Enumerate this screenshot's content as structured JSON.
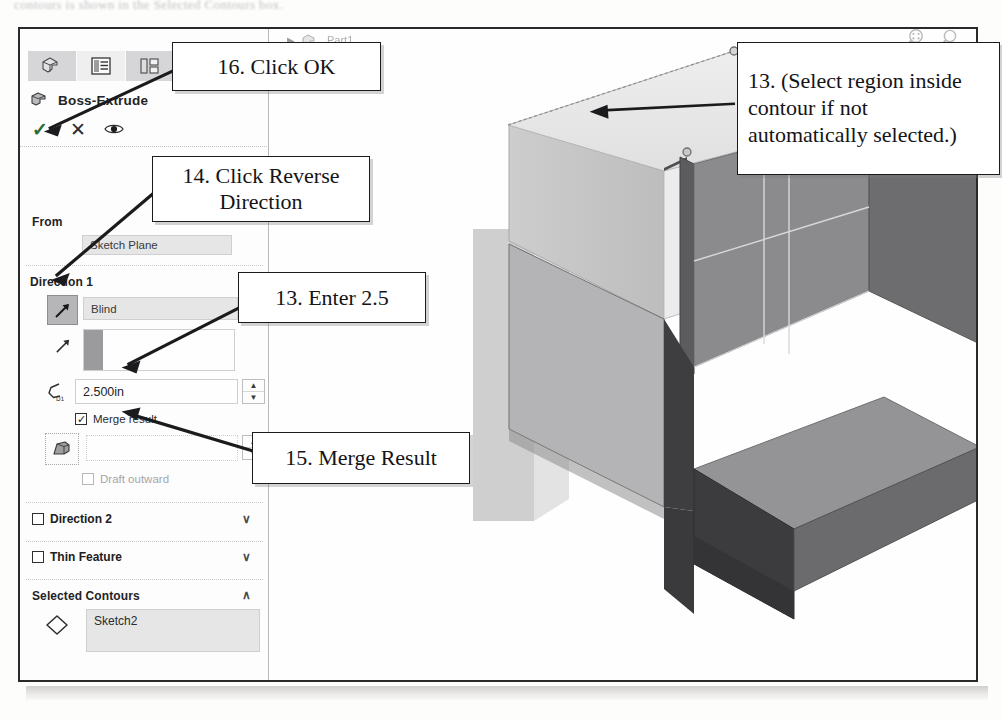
{
  "page": {
    "cutoff_top_text": "contours is shown in the Selected Contours box.",
    "app": "SolidWorks PropertyManager"
  },
  "property_manager": {
    "tabs": [
      {
        "name": "feature-manager-tab",
        "icon": "cube-icon",
        "active": false
      },
      {
        "name": "property-manager-tab",
        "icon": "list-properties-icon",
        "active": true
      },
      {
        "name": "configuration-manager-tab",
        "icon": "configurations-icon",
        "active": false
      },
      {
        "name": "dimxpert-manager-tab",
        "icon": "crosshair-target-icon",
        "active": false
      }
    ],
    "title": "Boss-Extrude",
    "title_icon": "boss-extrude-icon",
    "actions": [
      {
        "name": "ok-button",
        "icon": "check-icon",
        "label": "✓"
      },
      {
        "name": "cancel-button",
        "icon": "x-icon",
        "label": "✕"
      },
      {
        "name": "detailed-preview-button",
        "icon": "eye-icon",
        "label": "◉"
      }
    ],
    "from_group": {
      "header": "From",
      "start_condition": "Sketch Plane"
    },
    "direction1_group": {
      "header": "Direction 1",
      "reverse_direction_icon": "reverse-direction-arrow-icon",
      "end_condition": "Blind",
      "direction_vector_icon": "direction-vector-arrow-icon",
      "direction_vector_value": "",
      "depth_icon": "depth-d1-icon",
      "depth_value": "2.500in",
      "spinner_up": "▲",
      "spinner_down": "▼",
      "merge_result_label": "Merge result",
      "merge_result_checked": true,
      "draft_icon": "draft-angle-icon",
      "draft_value": "",
      "draft_outward_label": "Draft outward",
      "draft_outward_checked": false
    },
    "direction2_group": {
      "label": "Direction 2",
      "checked": false,
      "chevron": "∨"
    },
    "thin_feature_group": {
      "label": "Thin Feature",
      "checked": false,
      "chevron": "∨"
    },
    "selected_contours_group": {
      "header": "Selected Contours",
      "chevron": "∧",
      "contour_icon": "contour-diamond-icon",
      "contour_value": "Sketch2"
    }
  },
  "graphics_area": {
    "feature_tree_item": "Part1",
    "expand_icon": "triangle-right-icon",
    "part_icon": "part-document-icon",
    "view_tools": [
      {
        "name": "zoom-to-area-icon"
      },
      {
        "name": "magnifying-glass-icon"
      }
    ],
    "model": {
      "description": "Isometric shaded L-shaped bracket with translucent extrude preview",
      "colors": {
        "preview_top": "#e6e6e6",
        "preview_front": "#c9c9c9",
        "solid_top": "#9a9a9a",
        "solid_left_dark": "#4f4f4f",
        "solid_front": "#777777",
        "solid_right": "#8d8d8d",
        "edge": "#5a5a5a"
      }
    }
  },
  "callouts": [
    {
      "id": "callout-16",
      "number": "16.",
      "text": "16. Click OK",
      "target": "ok-button"
    },
    {
      "id": "callout-14",
      "number": "14.",
      "text": "14. Click Reverse\nDirection",
      "target": "reverse-direction-button"
    },
    {
      "id": "callout-13-enter",
      "number": "13.",
      "text": "13. Enter 2.5",
      "target": "depth-field"
    },
    {
      "id": "callout-15",
      "number": "15.",
      "text": "15. Merge Result",
      "target": "merge-result-checkbox"
    },
    {
      "id": "callout-13-region",
      "number": "13.",
      "text": "13. (Select region inside contour if not automatically selected.)",
      "target": "model-face"
    }
  ]
}
